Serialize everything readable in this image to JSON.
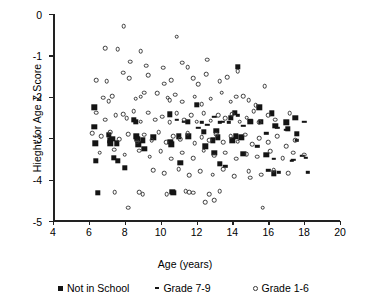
{
  "chart_data": {
    "type": "scatter",
    "title": "",
    "xlabel": "Age (years)",
    "ylabel": "Hieght for Age Z Score",
    "xlim": [
      4,
      20
    ],
    "ylim": [
      -5,
      0
    ],
    "xticks": [
      4,
      6,
      8,
      10,
      12,
      14,
      16,
      18,
      20
    ],
    "yticks": [
      0,
      -1,
      -2,
      -3,
      -4,
      -5
    ],
    "grid": false,
    "legend_position": "below-axes",
    "series": [
      {
        "name": "Not in School",
        "marker": "filled-square",
        "color": "#141414",
        "points": [
          [
            6.3,
            -2.25
          ],
          [
            6.3,
            -2.72
          ],
          [
            6.35,
            -3.12
          ],
          [
            6.4,
            -3.55
          ],
          [
            6.5,
            -4.32
          ],
          [
            7.1,
            -2.92
          ],
          [
            7.15,
            -3.05
          ],
          [
            7.2,
            -3.12
          ],
          [
            7.3,
            -3.02
          ],
          [
            7.4,
            -3.48
          ],
          [
            7.55,
            -3.12
          ],
          [
            7.6,
            -3.55
          ],
          [
            8.0,
            -3.72
          ],
          [
            8.5,
            -2.55
          ],
          [
            8.6,
            -2.6
          ],
          [
            8.65,
            -2.95
          ],
          [
            8.7,
            -3.02
          ],
          [
            8.75,
            -3.15
          ],
          [
            9.0,
            -3.05
          ],
          [
            9.1,
            -3.25
          ],
          [
            9.6,
            -2.98
          ],
          [
            10.5,
            -2.42
          ],
          [
            10.55,
            -3.08
          ],
          [
            10.6,
            -3.15
          ],
          [
            10.65,
            -4.3
          ],
          [
            10.7,
            -4.32
          ],
          [
            11.0,
            -2.95
          ],
          [
            11.1,
            -3.6
          ],
          [
            11.5,
            -2.6
          ],
          [
            11.55,
            -2.95
          ],
          [
            12.0,
            -2.2
          ],
          [
            12.4,
            -2.85
          ],
          [
            12.5,
            -3.2
          ],
          [
            12.9,
            -3.05
          ],
          [
            13.0,
            -3.35
          ],
          [
            13.1,
            -2.82
          ],
          [
            13.2,
            -2.98
          ],
          [
            13.3,
            -3.62
          ],
          [
            13.9,
            -2.5
          ],
          [
            14.0,
            -3.05
          ],
          [
            14.15,
            -2.38
          ],
          [
            14.2,
            -2.95
          ],
          [
            14.3,
            -1.28
          ],
          [
            14.5,
            -2.98
          ],
          [
            14.6,
            -3.38
          ],
          [
            15.0,
            -2.6
          ],
          [
            15.5,
            -2.25
          ],
          [
            15.6,
            -2.6
          ],
          [
            15.9,
            -3.4
          ],
          [
            16.2,
            -2.4
          ],
          [
            16.3,
            -3.85
          ],
          [
            16.4,
            -2.7
          ],
          [
            17.0,
            -2.62
          ],
          [
            17.1,
            -2.78
          ],
          [
            17.5,
            -2.5
          ],
          [
            17.6,
            -2.9
          ]
        ]
      },
      {
        "name": "Grade 7-9",
        "marker": "dash",
        "color": "#141414",
        "points": [
          [
            10.9,
            -2.55
          ],
          [
            11.3,
            -2.6
          ],
          [
            12.1,
            -2.75
          ],
          [
            12.3,
            -2.62
          ],
          [
            12.6,
            -2.68
          ],
          [
            13.0,
            -2.48
          ],
          [
            13.3,
            -2.62
          ],
          [
            13.45,
            -2.6
          ],
          [
            13.8,
            -2.62
          ],
          [
            14.3,
            -2.45
          ],
          [
            14.6,
            -2.7
          ],
          [
            15.0,
            -2.55
          ],
          [
            15.4,
            -3.2
          ],
          [
            15.6,
            -2.58
          ],
          [
            15.9,
            -2.88
          ],
          [
            16.0,
            -3.78
          ],
          [
            16.3,
            -3.5
          ],
          [
            16.5,
            -2.75
          ],
          [
            16.6,
            -3.82
          ],
          [
            17.0,
            -2.8
          ],
          [
            17.3,
            -3.55
          ],
          [
            17.4,
            -3.52
          ],
          [
            17.6,
            -3.05
          ],
          [
            17.9,
            -3.42
          ],
          [
            18.0,
            -2.6
          ],
          [
            18.1,
            -3.48
          ],
          [
            18.2,
            -3.82
          ],
          [
            13.6,
            -3.68
          ]
        ]
      },
      {
        "name": "Grade 1-6",
        "marker": "open-circle",
        "color": "#3a3a3a",
        "points": [
          [
            7.95,
            -0.3
          ],
          [
            6.9,
            -0.82
          ],
          [
            7.6,
            -0.85
          ],
          [
            8.9,
            -0.9
          ],
          [
            10.9,
            -0.55
          ],
          [
            8.3,
            -1.15
          ],
          [
            9.2,
            -1.25
          ],
          [
            11.2,
            -1.18
          ],
          [
            11.5,
            -1.28
          ],
          [
            12.6,
            -1.1
          ],
          [
            6.4,
            -1.6
          ],
          [
            7.0,
            -1.62
          ],
          [
            7.9,
            -1.42
          ],
          [
            8.25,
            -1.55
          ],
          [
            9.3,
            -1.48
          ],
          [
            10.2,
            -1.68
          ],
          [
            10.6,
            -1.6
          ],
          [
            11.8,
            -1.55
          ],
          [
            12.1,
            -1.7
          ],
          [
            13.3,
            -1.62
          ],
          [
            14.3,
            -1.38
          ],
          [
            6.8,
            -2.02
          ],
          [
            7.1,
            -2.1
          ],
          [
            7.3,
            -1.98
          ],
          [
            8.6,
            -2.05
          ],
          [
            8.9,
            -2.0
          ],
          [
            9.8,
            -1.92
          ],
          [
            10.4,
            -2.02
          ],
          [
            10.5,
            -2.08
          ],
          [
            10.8,
            -1.95
          ],
          [
            11.2,
            -2.12
          ],
          [
            11.9,
            -2.0
          ],
          [
            12.3,
            -2.18
          ],
          [
            12.8,
            -2.05
          ],
          [
            13.4,
            -1.9
          ],
          [
            13.9,
            -2.12
          ],
          [
            14.2,
            -2.0
          ],
          [
            14.9,
            -2.08
          ],
          [
            6.4,
            -2.38
          ],
          [
            6.9,
            -2.55
          ],
          [
            7.5,
            -2.45
          ],
          [
            7.9,
            -2.42
          ],
          [
            8.1,
            -2.52
          ],
          [
            8.5,
            -2.35
          ],
          [
            8.9,
            -2.6
          ],
          [
            9.3,
            -2.38
          ],
          [
            9.7,
            -2.55
          ],
          [
            10.1,
            -2.48
          ],
          [
            10.5,
            -2.62
          ],
          [
            10.9,
            -2.4
          ],
          [
            11.3,
            -2.55
          ],
          [
            11.7,
            -2.45
          ],
          [
            12.0,
            -2.6
          ],
          [
            12.4,
            -2.4
          ],
          [
            12.8,
            -2.58
          ],
          [
            13.2,
            -2.45
          ],
          [
            13.6,
            -2.52
          ],
          [
            14.0,
            -2.42
          ],
          [
            14.4,
            -2.6
          ],
          [
            14.8,
            -2.5
          ],
          [
            15.2,
            -2.35
          ],
          [
            15.5,
            -2.62
          ],
          [
            16.0,
            -2.45
          ],
          [
            16.4,
            -2.55
          ],
          [
            17.2,
            -2.4
          ],
          [
            6.2,
            -2.88
          ],
          [
            6.7,
            -2.95
          ],
          [
            7.2,
            -2.85
          ],
          [
            7.7,
            -3.02
          ],
          [
            8.2,
            -2.9
          ],
          [
            8.7,
            -3.08
          ],
          [
            9.1,
            -2.92
          ],
          [
            9.5,
            -3.05
          ],
          [
            9.9,
            -2.85
          ],
          [
            10.3,
            -3.1
          ],
          [
            10.7,
            -2.95
          ],
          [
            11.1,
            -3.02
          ],
          [
            11.5,
            -2.88
          ],
          [
            11.9,
            -3.12
          ],
          [
            12.3,
            -2.98
          ],
          [
            12.7,
            -3.05
          ],
          [
            13.1,
            -2.9
          ],
          [
            13.5,
            -3.1
          ],
          [
            13.9,
            -2.95
          ],
          [
            14.3,
            -3.08
          ],
          [
            14.7,
            -2.92
          ],
          [
            15.1,
            -3.15
          ],
          [
            15.5,
            -3.0
          ],
          [
            16.0,
            -3.1
          ],
          [
            16.5,
            -2.95
          ],
          [
            17.0,
            -3.2
          ],
          [
            17.5,
            -3.05
          ],
          [
            6.6,
            -3.35
          ],
          [
            7.4,
            -3.28
          ],
          [
            8.0,
            -3.4
          ],
          [
            8.8,
            -3.3
          ],
          [
            9.4,
            -3.45
          ],
          [
            10.0,
            -3.32
          ],
          [
            10.6,
            -3.5
          ],
          [
            11.2,
            -3.35
          ],
          [
            11.8,
            -3.48
          ],
          [
            12.4,
            -3.3
          ],
          [
            13.0,
            -3.42
          ],
          [
            13.6,
            -3.35
          ],
          [
            14.2,
            -3.5
          ],
          [
            14.8,
            -3.38
          ],
          [
            15.4,
            -3.45
          ],
          [
            16.1,
            -3.32
          ],
          [
            16.8,
            -3.48
          ],
          [
            17.4,
            -3.35
          ],
          [
            18.0,
            -3.4
          ],
          [
            9.6,
            -3.78
          ],
          [
            10.2,
            -3.85
          ],
          [
            11.0,
            -3.75
          ],
          [
            11.6,
            -3.9
          ],
          [
            12.2,
            -3.8
          ],
          [
            12.9,
            -3.88
          ],
          [
            13.5,
            -3.75
          ],
          [
            14.1,
            -3.92
          ],
          [
            14.9,
            -3.8
          ],
          [
            15.6,
            -3.88
          ],
          [
            16.3,
            -3.78
          ],
          [
            17.1,
            -3.85
          ],
          [
            15.0,
            -3.95
          ],
          [
            8.8,
            -4.3
          ],
          [
            9.0,
            -4.35
          ],
          [
            11.4,
            -4.28
          ],
          [
            11.6,
            -4.3
          ],
          [
            11.8,
            -4.32
          ],
          [
            12.7,
            -4.35
          ],
          [
            13.3,
            -4.28
          ],
          [
            12.5,
            -4.55
          ],
          [
            13.0,
            -4.5
          ],
          [
            8.2,
            -4.68
          ],
          [
            15.7,
            -4.68
          ],
          [
            10.35,
            -4.35
          ],
          [
            7.45,
            -4.3
          ],
          [
            9.1,
            -1.9
          ],
          [
            12.55,
            -1.45
          ],
          [
            10.15,
            -1.3
          ],
          [
            13.7,
            -1.52
          ],
          [
            15.8,
            -1.75
          ],
          [
            14.6,
            -1.98
          ],
          [
            15.3,
            -2.2
          ]
        ]
      }
    ]
  },
  "axis": {
    "x_title": "Age (years)",
    "y_title": "Hieght for Age Z Score",
    "x_tick_labels": [
      "4",
      "6",
      "8",
      "10",
      "12",
      "14",
      "16",
      "18",
      "20"
    ],
    "y_tick_labels": [
      "0",
      "-1",
      "-2",
      "-3",
      "-4",
      "-5"
    ]
  },
  "legend": {
    "items": [
      {
        "label": "Not in School",
        "marker": "filled-square"
      },
      {
        "label": "Grade 7-9",
        "marker": "dash"
      },
      {
        "label": "Grade 1-6",
        "marker": "open-circle"
      }
    ]
  },
  "colors": {
    "axis": "#222222",
    "marker_fill": "#141414",
    "marker_stroke": "#3a3a3a",
    "background": "#ffffff"
  }
}
